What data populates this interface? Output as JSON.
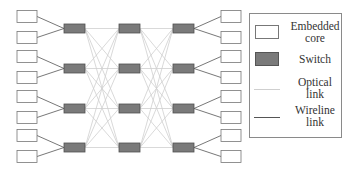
{
  "legend": {
    "items": [
      {
        "key": "embedded-core",
        "label": "Embedded core"
      },
      {
        "key": "switch",
        "label": "Switch"
      },
      {
        "key": "optical-link",
        "label": "Optical link"
      },
      {
        "key": "wireline-link",
        "label": "Wireline link"
      }
    ]
  },
  "colors": {
    "core_fill": "#ffffff",
    "core_stroke": "#777777",
    "switch_fill": "#7a7a7a",
    "switch_stroke": "#505050",
    "optical_link": "#cfcfcf",
    "wireline_link": "#555555"
  },
  "topology": {
    "rows": 4,
    "switch_columns": 3,
    "cores_per_edge_switch": 2,
    "switch_columns_x": [
      64,
      119,
      173
    ],
    "row_y": [
      24,
      64,
      104,
      143
    ]
  }
}
